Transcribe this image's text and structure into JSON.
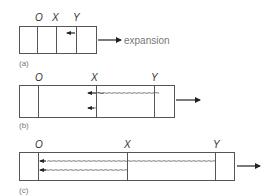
{
  "figure": {
    "panels": [
      {
        "id": "a",
        "caption": "(a)",
        "markers": {
          "O": "O",
          "X": "X",
          "Y": "Y"
        },
        "arrow_label": "expansion"
      },
      {
        "id": "b",
        "caption": "(b)",
        "markers": {
          "O": "O",
          "X": "X",
          "Y": "Y"
        }
      },
      {
        "id": "c",
        "caption": "(c)",
        "markers": {
          "O": "O",
          "X": "X",
          "Y": "Y"
        }
      }
    ],
    "colors": {
      "line": "#555555",
      "arrow": "#222222",
      "caption": "#777777"
    }
  }
}
